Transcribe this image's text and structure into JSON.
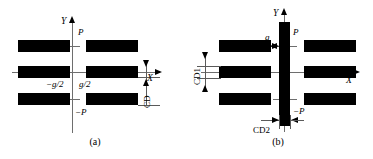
{
  "figure": {
    "type": "technical-diagram",
    "background_color": "#ffffff",
    "bar_color": "#000000",
    "axis_color": "#6e6e6e"
  },
  "panels": [
    {
      "id": "a",
      "caption": "(a)",
      "axes": {
        "x_label": "X",
        "y_label": "Y"
      },
      "tick_labels": {
        "positive_pitch": "P",
        "negative_pitch": "−P"
      },
      "dimensions": [
        {
          "name": "gap-left",
          "label": "−g/2"
        },
        {
          "name": "gap-right",
          "label": "g/2"
        },
        {
          "name": "critical-dimension",
          "label": "CD"
        }
      ],
      "bars": {
        "count": 6,
        "arrangement": "three rows of two bars, split left and right of the Y axis"
      }
    },
    {
      "id": "b",
      "caption": "(b)",
      "axes": {
        "x_label": "X",
        "y_label": "Y"
      },
      "tick_labels": {
        "positive_pitch": "P",
        "negative_pitch": "−P"
      },
      "dimensions": [
        {
          "name": "gap",
          "label": "g"
        },
        {
          "name": "critical-dimension-1",
          "label": "CD1"
        },
        {
          "name": "critical-dimension-2",
          "label": "CD2"
        }
      ],
      "bars": {
        "count": 7,
        "arrangement": "three rows of two horizontal bars plus one central vertical bar on the Y axis"
      }
    }
  ]
}
